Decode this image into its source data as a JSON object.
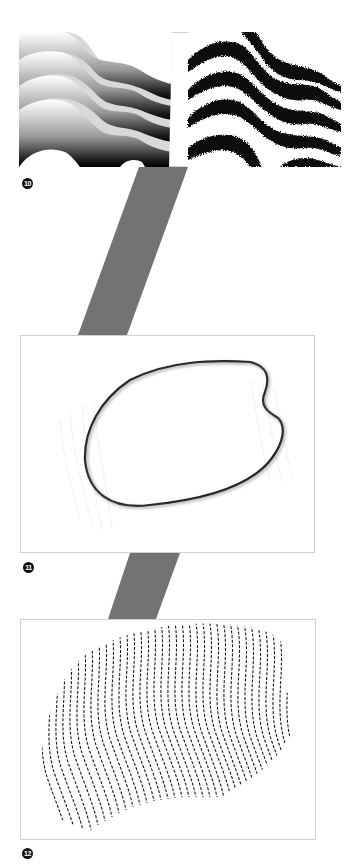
{
  "figures": [
    {
      "id": "fig10",
      "label": "10",
      "description": "Two panels of wavy horizontal bands: left with smooth grayscale gradients, right with noisy black stippled bands",
      "frame": {
        "x": 19,
        "y": 32,
        "w": 322,
        "h": 135
      },
      "badge": {
        "x": 22,
        "y": 178
      }
    },
    {
      "id": "fig11",
      "label": "11",
      "description": "Kidney-shaped blob outlined with dark shaded edge over faint vertical contour lines",
      "frame": {
        "x": 20,
        "y": 335,
        "w": 295,
        "h": 218
      },
      "badge": {
        "x": 23,
        "y": 562
      }
    },
    {
      "id": "fig12",
      "label": "12",
      "description": "Same blob filled with dashed wavy vertical lines",
      "frame": {
        "x": 20,
        "y": 619,
        "w": 296,
        "h": 221
      },
      "badge": {
        "x": 22,
        "y": 848
      }
    }
  ],
  "connectors": [
    {
      "from": "fig10",
      "to": "fig11",
      "points": "139,167 188,167 127,335 78,335"
    },
    {
      "from": "fig11",
      "to": "fig12",
      "points": "130,553 180,553 156,619 108,619"
    }
  ],
  "colors": {
    "connector": "#737373",
    "frame_border": "#cfcfcf",
    "badge_bg": "#111111",
    "badge_text": "#ffffff",
    "ink": "#111111"
  }
}
